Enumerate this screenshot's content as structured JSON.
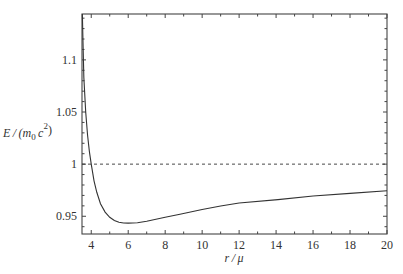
{
  "chart_data": {
    "type": "line",
    "title": "",
    "xlabel": "r / μ",
    "ylabel": "E / (m₀ c²)",
    "xlim": [
      3.5,
      20
    ],
    "ylim": [
      0.933,
      1.144
    ],
    "grid": false,
    "legend": null,
    "x_ticks": [
      4,
      6,
      8,
      10,
      12,
      14,
      16,
      18,
      20
    ],
    "x_tick_labels": [
      "4",
      "6",
      "8",
      "10",
      "12",
      "14",
      "16",
      "18",
      "20"
    ],
    "y_ticks": [
      0.95,
      1.0,
      1.05,
      1.1
    ],
    "y_tick_labels": [
      "0.95",
      "1",
      "1.05",
      "1.1"
    ],
    "series": [
      {
        "name": "E(r)",
        "style": "solid",
        "x": [
          3.52,
          3.55,
          3.6,
          3.7,
          3.8,
          3.9,
          4.0,
          4.15,
          4.3,
          4.5,
          4.75,
          5.0,
          5.25,
          5.5,
          5.75,
          6.0,
          6.5,
          7.0,
          8.0,
          8.8,
          10.0,
          11.0,
          12.0,
          14.1,
          16.0,
          18.0,
          20.0
        ],
        "y": [
          1.144,
          1.12,
          1.083,
          1.05,
          1.028,
          1.012,
          1.0,
          0.984,
          0.973,
          0.962,
          0.954,
          0.949,
          0.946,
          0.9443,
          0.9436,
          0.9434,
          0.9438,
          0.9452,
          0.949,
          0.952,
          0.9565,
          0.9598,
          0.9628,
          0.966,
          0.9695,
          0.972,
          0.9745
        ]
      },
      {
        "name": "E = 1 reference",
        "style": "dashed",
        "x": [
          3.5,
          20
        ],
        "y": [
          1.0,
          1.0
        ]
      }
    ]
  }
}
